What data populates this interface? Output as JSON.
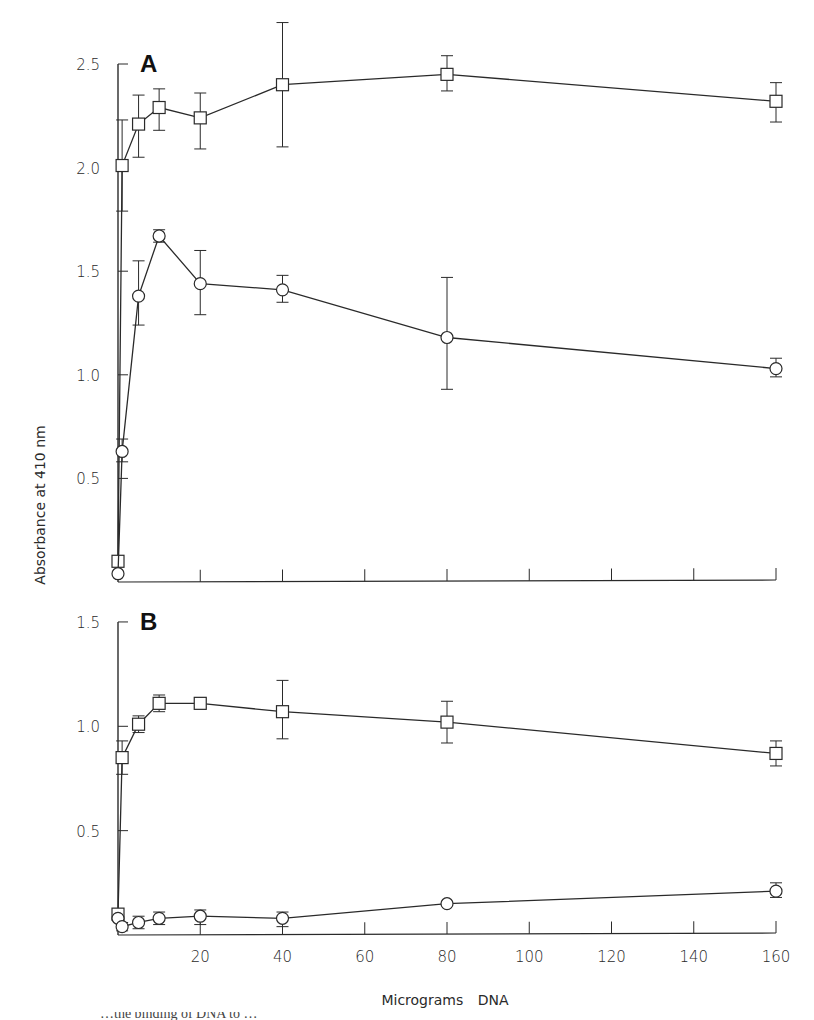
{
  "chart_data": [
    {
      "type": "line",
      "panel_label": "A",
      "title": "",
      "xlabel": "Micrograms DNA",
      "ylabel": "Absorbance at 410 nm",
      "xlim": [
        0,
        160
      ],
      "ylim": [
        0,
        2.5
      ],
      "x_ticks": [
        20,
        40,
        60,
        80,
        100,
        120,
        140,
        160
      ],
      "y_ticks": [
        0.5,
        1.0,
        1.5,
        2.0,
        2.5
      ],
      "y_tick_labels": [
        "0.5",
        "1.0",
        "1.5",
        "2.0",
        "2.5"
      ],
      "grid": false,
      "legend": null,
      "series": [
        {
          "name": "squares",
          "marker": "square",
          "x": [
            0,
            1,
            5,
            10,
            20,
            40,
            80,
            160
          ],
          "values": [
            0.1,
            2.01,
            2.21,
            2.29,
            2.24,
            2.4,
            2.45,
            2.32
          ],
          "err_low": [
            0.1,
            1.79,
            2.05,
            2.18,
            2.09,
            2.1,
            2.37,
            2.22
          ],
          "err_high": [
            0.1,
            2.23,
            2.35,
            2.38,
            2.36,
            2.7,
            2.54,
            2.41
          ]
        },
        {
          "name": "circles",
          "marker": "circle",
          "x": [
            0,
            1,
            5,
            10,
            20,
            40,
            80,
            160
          ],
          "values": [
            0.04,
            0.63,
            1.38,
            1.67,
            1.44,
            1.41,
            1.18,
            1.03
          ],
          "err_low": [
            0.04,
            0.58,
            1.24,
            1.64,
            1.29,
            1.35,
            0.93,
            0.99
          ],
          "err_high": [
            0.04,
            0.69,
            1.55,
            1.7,
            1.6,
            1.48,
            1.47,
            1.08
          ]
        }
      ]
    },
    {
      "type": "line",
      "panel_label": "B",
      "title": "",
      "xlabel": "Micrograms DNA",
      "ylabel": "Absorbance at 410 nm",
      "xlim": [
        0,
        160
      ],
      "ylim": [
        0,
        1.5
      ],
      "x_ticks": [
        20,
        40,
        60,
        80,
        100,
        120,
        140,
        160
      ],
      "x_tick_labels": [
        "20",
        "40",
        "60",
        "80",
        "100",
        "120",
        "140",
        "160"
      ],
      "y_ticks": [
        0.5,
        1.0,
        1.5
      ],
      "y_tick_labels": [
        "0.5",
        "1.0",
        "1.5"
      ],
      "grid": false,
      "legend": null,
      "series": [
        {
          "name": "squares",
          "marker": "square",
          "x": [
            0,
            1,
            5,
            10,
            20,
            40,
            80,
            160
          ],
          "values": [
            0.1,
            0.85,
            1.01,
            1.11,
            1.11,
            1.07,
            1.02,
            0.87
          ],
          "err_low": [
            0.1,
            0.77,
            0.97,
            1.07,
            1.09,
            0.94,
            0.92,
            0.81
          ],
          "err_high": [
            0.1,
            0.93,
            1.05,
            1.15,
            1.13,
            1.22,
            1.12,
            0.93
          ]
        },
        {
          "name": "circles",
          "marker": "circle",
          "x": [
            0,
            1,
            5,
            10,
            20,
            40,
            80,
            160
          ],
          "values": [
            0.08,
            0.04,
            0.06,
            0.08,
            0.09,
            0.08,
            0.15,
            0.21
          ],
          "err_low": [
            0.08,
            0.02,
            0.03,
            0.05,
            0.05,
            0.04,
            0.15,
            0.18
          ],
          "err_high": [
            0.08,
            0.06,
            0.09,
            0.11,
            0.12,
            0.11,
            0.15,
            0.25
          ]
        }
      ]
    }
  ],
  "figure": {
    "ylabel": "Absorbance at 410 nm",
    "xlabel": "Micrograms DNA",
    "x_tick_labels": [
      "20",
      "40",
      "60",
      "80",
      "100",
      "120",
      "140",
      "160"
    ],
    "caption_fragment": "…the binding of DNA to …"
  }
}
